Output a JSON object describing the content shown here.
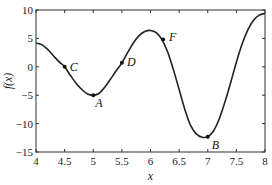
{
  "chart_data": {
    "type": "line",
    "title": "",
    "xlabel": "x",
    "ylabel": "f(x)",
    "xlim": [
      4,
      8
    ],
    "ylim": [
      -15,
      10
    ],
    "xticks": [
      4,
      4.5,
      5,
      5.5,
      6,
      6.5,
      7,
      7.5,
      8
    ],
    "yticks": [
      10,
      5,
      0,
      -5,
      -10,
      -15
    ],
    "xtick_labels": [
      "4",
      "4.5",
      "5",
      "5.5",
      "6",
      "6.5",
      "7",
      "7.5",
      "8"
    ],
    "ytick_labels": [
      "10",
      "5",
      "0",
      "−5",
      "−10",
      "−15"
    ],
    "grid": false,
    "legend": null,
    "series": [
      {
        "name": "f(x)",
        "color": "#222222",
        "x": [
          4.0,
          4.1,
          4.2,
          4.3,
          4.4,
          4.5,
          4.6,
          4.7,
          4.8,
          4.9,
          5.0,
          5.1,
          5.2,
          5.3,
          5.4,
          5.5,
          5.6,
          5.7,
          5.8,
          5.9,
          6.0,
          6.1,
          6.2,
          6.3,
          6.4,
          6.5,
          6.6,
          6.7,
          6.8,
          6.9,
          7.0,
          7.1,
          7.2,
          7.3,
          7.4,
          7.5,
          7.6,
          7.7,
          7.8,
          7.9,
          8.0
        ],
        "y": [
          4.2,
          3.9,
          3.1,
          2.0,
          0.9,
          0.0,
          -1.5,
          -2.9,
          -4.0,
          -4.8,
          -5.0,
          -4.7,
          -3.6,
          -2.2,
          -0.7,
          0.7,
          2.5,
          4.2,
          5.5,
          6.2,
          6.4,
          6.0,
          4.8,
          2.6,
          -0.5,
          -4.0,
          -7.5,
          -10.3,
          -11.8,
          -12.4,
          -12.3,
          -11.3,
          -9.2,
          -6.2,
          -2.8,
          0.8,
          4.0,
          6.5,
          8.2,
          9.1,
          9.4
        ]
      }
    ],
    "annotations": [
      {
        "label": "A",
        "x": 5.0,
        "y": -5.0
      },
      {
        "label": "B",
        "x": 7.0,
        "y": -12.3
      },
      {
        "label": "C",
        "x": 4.5,
        "y": 0.0
      },
      {
        "label": "D",
        "x": 5.5,
        "y": 0.7
      },
      {
        "label": "F",
        "x": 6.22,
        "y": 4.8
      }
    ]
  }
}
